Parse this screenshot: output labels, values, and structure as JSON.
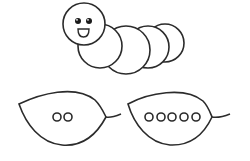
{
  "figure": {
    "stroke_color": "#2b2b2b",
    "fill_color": "#ffffff",
    "caterpillar": {
      "head": {
        "cx": 84,
        "cy": 24,
        "r": 21
      },
      "segments": [
        {
          "cx": 165,
          "cy": 43,
          "r": 19
        },
        {
          "cx": 148,
          "cy": 47,
          "r": 21
        },
        {
          "cx": 126,
          "cy": 50,
          "r": 24
        },
        {
          "cx": 100,
          "cy": 46,
          "r": 22
        }
      ],
      "eyes": [
        {
          "cx": 78,
          "cy": 21,
          "r": 3
        },
        {
          "cx": 89,
          "cy": 21,
          "r": 3
        }
      ]
    },
    "leaves": [
      {
        "label": "leaf-with-2-dots",
        "dot_count": 2,
        "dots_x": [
          57,
          68
        ],
        "dots_y": 117
      },
      {
        "label": "leaf-with-5-dots",
        "dot_count": 5,
        "dots_x": [
          149,
          161,
          172,
          184,
          196
        ],
        "dots_y": 117
      }
    ]
  }
}
